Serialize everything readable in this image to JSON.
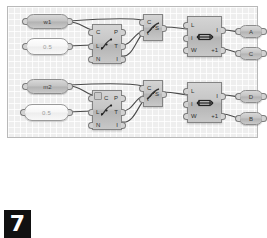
{
  "app": {
    "title": "Grasshopper Canvas",
    "page_badge": "7",
    "canvas_background": "#eeeeee",
    "node_fill": "#c6c6c6",
    "node_border": "#838383",
    "wire_color": "#4a4a4a"
  },
  "nodes": {
    "row1": {
      "param_w1": {
        "label": "w1",
        "kind": "slider-param"
      },
      "param_num1": {
        "label": "0.5",
        "kind": "number-param"
      },
      "divide": {
        "name": "divide-curve-component",
        "icon": "divide-curve-icon",
        "inputs": [
          "C",
          "L",
          "N"
        ],
        "outputs": [
          "P",
          "T",
          "I"
        ]
      },
      "evaluate": {
        "name": "evaluate-curve-component",
        "icon": "evaluate-curve-icon",
        "inputs": [
          "C",
          "t"
        ],
        "outputs": [
          "S"
        ]
      },
      "frame": {
        "name": "rectangle-component",
        "icon": "rectangle-icon",
        "inputs": [
          "L",
          "I",
          "W"
        ],
        "outputs": [
          "I",
          "+1"
        ]
      },
      "out_a": {
        "label": "A",
        "kind": "output-param"
      },
      "out_c": {
        "label": "C",
        "kind": "output-param"
      }
    },
    "row2": {
      "param_m2": {
        "label": "m2",
        "kind": "slider-param"
      },
      "param_num2": {
        "label": "0.5",
        "kind": "number-param"
      },
      "divide": {
        "name": "divide-curve-component",
        "icon": "divide-curve-icon",
        "badge": "flag-icon",
        "inputs": [
          "C",
          "L",
          "N"
        ],
        "outputs": [
          "P",
          "T",
          "I"
        ]
      },
      "evaluate": {
        "name": "evaluate-curve-component",
        "icon": "evaluate-curve-icon",
        "inputs": [
          "C",
          "t"
        ],
        "outputs": [
          "S"
        ]
      },
      "frame": {
        "name": "rectangle-component",
        "icon": "rectangle-icon",
        "inputs": [
          "L",
          "I",
          "W"
        ],
        "outputs": [
          "I",
          "+1"
        ]
      },
      "out_d": {
        "label": "D",
        "kind": "output-param"
      },
      "out_b": {
        "label": "B",
        "kind": "output-param"
      }
    }
  }
}
